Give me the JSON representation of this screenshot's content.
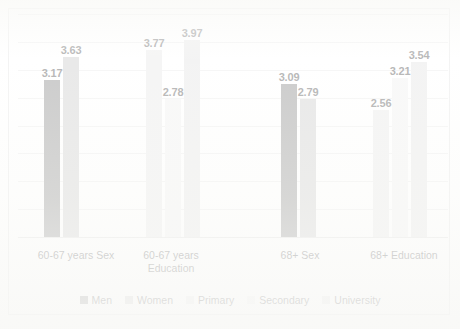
{
  "chart_data": {
    "type": "bar",
    "title": "",
    "subtitle": "",
    "xlabel": "",
    "ylabel": "",
    "ylim": [
      0,
      4.5
    ],
    "grid": true,
    "legend_position": "bottom",
    "categories": [
      "60-67 years Sex",
      "60-67 years Education",
      "68+ Sex",
      "68+ Education"
    ],
    "series": [
      {
        "name": "Men",
        "color": "#808080",
        "values": [
          3.17,
          null,
          3.09,
          null
        ]
      },
      {
        "name": "Women",
        "color": "#c8c8c8",
        "values": [
          3.63,
          null,
          2.79,
          null
        ]
      },
      {
        "name": "Primary",
        "color": "#e6e6e6",
        "values": [
          null,
          3.77,
          null,
          2.56
        ]
      },
      {
        "name": "Secondary",
        "color": "#efefef",
        "values": [
          null,
          2.78,
          null,
          3.21
        ]
      },
      {
        "name": "University",
        "color": "#e2e2e2",
        "values": [
          null,
          3.97,
          null,
          3.54
        ]
      }
    ],
    "bars": [
      {
        "group": "60-67 years Sex",
        "series": "Men",
        "value": 3.17,
        "label": "3.17",
        "color": "#808080",
        "x": 26,
        "w": 16
      },
      {
        "group": "60-67 years Sex",
        "series": "Women",
        "value": 3.63,
        "label": "3.63",
        "color": "#c8c8c8",
        "x": 45,
        "w": 16
      },
      {
        "group": "60-67 years Education",
        "series": "Primary",
        "value": 3.77,
        "label": "3.77",
        "color": "#e6e6e6",
        "x": 128,
        "w": 16
      },
      {
        "group": "60-67 years Education",
        "series": "Secondary",
        "value": 2.78,
        "label": "2.78",
        "color": "#efefef",
        "x": 147,
        "w": 16
      },
      {
        "group": "60-67 years Education",
        "series": "University",
        "value": 3.97,
        "label": "3.97",
        "color": "#e2e2e2",
        "x": 166,
        "w": 16
      },
      {
        "group": "68+ Sex",
        "series": "Men",
        "value": 3.09,
        "label": "3.09",
        "color": "#808080",
        "x": 263,
        "w": 16
      },
      {
        "group": "68+ Sex",
        "series": "Women",
        "value": 2.79,
        "label": "2.79",
        "color": "#c8c8c8",
        "x": 282,
        "w": 16
      },
      {
        "group": "68+ Education",
        "series": "Primary",
        "value": 2.56,
        "label": "2.56",
        "color": "#e6e6e6",
        "x": 355,
        "w": 16
      },
      {
        "group": "68+ Education",
        "series": "Secondary",
        "value": 3.21,
        "label": "3.21",
        "color": "#efefef",
        "x": 374,
        "w": 16
      },
      {
        "group": "68+ Education",
        "series": "University",
        "value": 3.54,
        "label": "3.54",
        "color": "#e2e2e2",
        "x": 393,
        "w": 16
      }
    ],
    "gridline_count": 9,
    "axis_labels": [
      {
        "text": "60-67 years Sex",
        "x": 3,
        "w": 110
      },
      {
        "text": "60-67 years Education",
        "x": 108,
        "w": 90
      },
      {
        "text": "68+ Sex",
        "x": 245,
        "w": 74
      },
      {
        "text": "68+ Education",
        "x": 338,
        "w": 96
      }
    ],
    "legend": [
      {
        "label": "Men",
        "color": "#808080"
      },
      {
        "label": "Women",
        "color": "#c8c8c8"
      },
      {
        "label": "Primary",
        "color": "#e6e6e6"
      },
      {
        "label": "Secondary",
        "color": "#efefef"
      },
      {
        "label": "University",
        "color": "#e2e2e2"
      }
    ],
    "colors": {
      "gridline": "#e9e9e9",
      "baseline": "#d9d9d9",
      "frame_border": "#e2e2e2",
      "label_text": "#4a4a4a",
      "axis_text": "#3f3f3f",
      "background": "#ffffff"
    }
  }
}
